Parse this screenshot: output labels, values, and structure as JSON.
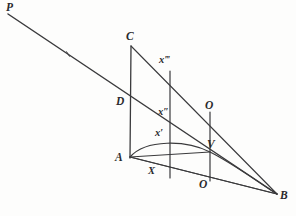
{
  "figure": {
    "kind": "geometry-diagram",
    "title": "",
    "ink_color": "#3a3a3c",
    "background_color": "#fdfdfc",
    "width": 296,
    "height": 216,
    "points": [
      {
        "id": "P",
        "label": "P",
        "x": 8,
        "y": 14,
        "label_x": 6,
        "label_y": 2,
        "size": "sz-lg"
      },
      {
        "id": "C",
        "label": "C",
        "x": 131,
        "y": 46,
        "label_x": 126,
        "label_y": 31,
        "size": "sz-lg"
      },
      {
        "id": "X3",
        "label": "x",
        "primes": "‴",
        "x": 170,
        "y": 72,
        "label_x": 159,
        "label_y": 55,
        "size": "sz-md"
      },
      {
        "id": "D",
        "label": "D",
        "x": 130,
        "y": 103,
        "label_x": 116,
        "label_y": 96,
        "size": "sz-lg"
      },
      {
        "id": "X2",
        "label": "x",
        "primes": "″",
        "x": 170,
        "y": 117,
        "label_x": 158,
        "label_y": 107,
        "size": "sz-md"
      },
      {
        "id": "Oup",
        "label": "O",
        "x": 210,
        "y": 113,
        "label_x": 205,
        "label_y": 100,
        "size": "sz-lg"
      },
      {
        "id": "X1",
        "label": "x",
        "primes": "′",
        "x": 170,
        "y": 143,
        "label_x": 155,
        "label_y": 128,
        "size": "sz-md"
      },
      {
        "id": "A",
        "label": "A",
        "x": 130,
        "y": 157,
        "label_x": 115,
        "label_y": 152,
        "size": "sz-lg"
      },
      {
        "id": "V",
        "label": "V",
        "x": 210,
        "y": 152,
        "label_x": 207,
        "label_y": 139,
        "size": "sz-lg"
      },
      {
        "id": "X",
        "label": "X",
        "x": 170,
        "y": 177,
        "label_x": 148,
        "label_y": 166,
        "size": "sz-md"
      },
      {
        "id": "Olow",
        "label": "O",
        "x": 210,
        "y": 180,
        "label_x": 199,
        "label_y": 179,
        "size": "sz-lg"
      },
      {
        "id": "B",
        "label": "B",
        "x": 277,
        "y": 194,
        "label_x": 280,
        "label_y": 190,
        "size": "sz-lg"
      }
    ],
    "segments": [
      {
        "id": "seg-P-to-B",
        "name": "transversal-P-B",
        "x1": 8,
        "y1": 14,
        "x2": 277,
        "y2": 194,
        "width": 1.5
      },
      {
        "id": "seg-C-to-B",
        "name": "ray-C-B",
        "x1": 131,
        "y1": 46,
        "x2": 277,
        "y2": 194,
        "width": 1.1
      },
      {
        "id": "seg-A-to-B",
        "name": "base-A-B",
        "x1": 130,
        "y1": 157,
        "x2": 277,
        "y2": 194,
        "width": 1.1
      },
      {
        "id": "seg-C-to-A",
        "name": "vertical-C-A",
        "x1": 131,
        "y1": 46,
        "x2": 130,
        "y2": 158,
        "width": 1.3
      },
      {
        "id": "seg-X3-to-X",
        "name": "ordinate-x3-X",
        "x1": 170,
        "y1": 71,
        "x2": 170,
        "y2": 178,
        "width": 1.2
      },
      {
        "id": "seg-Oup-to-Olow",
        "name": "ordinate-O-O",
        "x1": 210,
        "y1": 112,
        "x2": 210,
        "y2": 181,
        "width": 1.2
      },
      {
        "id": "seg-A-to-V",
        "name": "chord-A-V",
        "x1": 130,
        "y1": 157,
        "x2": 210,
        "y2": 152,
        "width": 1.1
      },
      {
        "id": "seg-A-to-Bmid",
        "name": "secondary-A-B",
        "x1": 130,
        "y1": 157,
        "x2": 277,
        "y2": 194,
        "width": 1.0
      }
    ],
    "curves": [
      {
        "id": "curve-A-V-B",
        "name": "conic-arc-A-V-B",
        "d": "M 130 157 C 146 139, 186 140, 210 152 C 234 164, 262 185, 277 194",
        "width": 1.2
      }
    ],
    "ticks": [
      {
        "id": "tick-PB-mid",
        "name": "tick-mark-on-transversal",
        "x": 68,
        "y": 54
      }
    ]
  }
}
